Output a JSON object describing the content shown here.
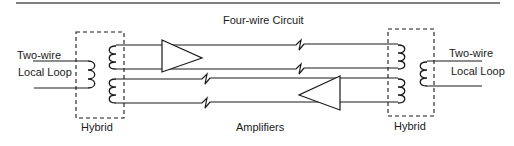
{
  "diagram": {
    "title": "Four-wire Circuit",
    "left_loop": {
      "line1": "Two-wire",
      "line2": "Local Loop"
    },
    "right_loop": {
      "line1": "Two-wire",
      "line2": "Local Loop"
    },
    "left_hybrid_label": "Hybrid",
    "right_hybrid_label": "Hybrid",
    "amplifiers_label": "Amplifiers",
    "colors": {
      "ink": "#1a1a1a",
      "rule": "#555555",
      "background": "#ffffff"
    }
  }
}
